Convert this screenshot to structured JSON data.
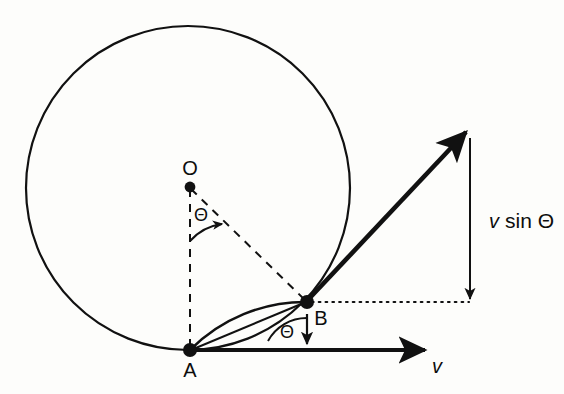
{
  "figure": {
    "background_color": "#fdfdfb",
    "ink_color": "#111111",
    "labels": {
      "center_point": "O",
      "contact_point": "A",
      "rim_point": "B",
      "angle_at_center": "Θ",
      "angle_at_rim": "Θ",
      "velocity_axis": "v",
      "vertical_component": "v sin Θ",
      "vertical_component_v": "v",
      "vertical_component_rest": "sin Θ"
    },
    "geometry": {
      "circle": {
        "cx": 188,
        "cy": 188,
        "r": 162
      },
      "point_O": {
        "x": 190,
        "y": 187
      },
      "point_A": {
        "x": 190,
        "y": 350
      },
      "point_B": {
        "x": 307,
        "y": 302
      },
      "velocity_arrow_tip": {
        "x": 467,
        "y": 131
      },
      "axis_arrow_tip": {
        "x": 425,
        "y": 350
      },
      "vertical_drop_x": 470,
      "vertical_drop_top_y": 140,
      "vertical_drop_bottom_y": 301
    },
    "label_positions": {
      "O": {
        "x": 190,
        "y": 175
      },
      "A": {
        "x": 190,
        "y": 375
      },
      "B": {
        "x": 322,
        "y": 323
      },
      "theta_center": {
        "x": 200,
        "y": 220
      },
      "theta_rim": {
        "x": 287,
        "y": 337
      },
      "v_axis": {
        "x": 437,
        "y": 372
      },
      "v_sin_theta": {
        "x": 487,
        "y": 227
      }
    }
  }
}
